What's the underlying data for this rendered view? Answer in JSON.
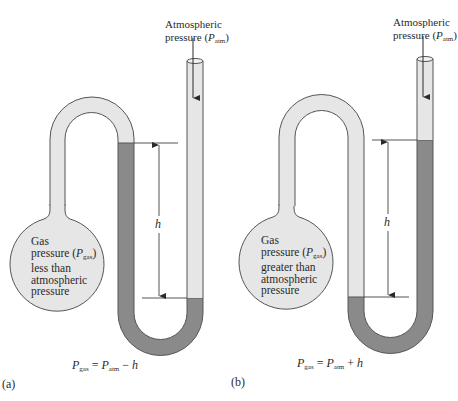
{
  "figure": {
    "colors": {
      "tube_fill": "#e6e6e6",
      "tube_stroke": "#555555",
      "liquid_fill": "#8a8a8a",
      "background": "#ffffff",
      "text": "#2a2a2a"
    },
    "panels": [
      {
        "id": "a",
        "panel_label": "(a)",
        "atm_label_line1": "Atmospheric",
        "atm_label_line2_prefix": "pressure (",
        "atm_symbol": "P",
        "atm_subscript": "atm",
        "atm_label_line2_suffix": ")",
        "gas_line1": "Gas",
        "gas_line2_prefix": "pressure (",
        "gas_symbol": "P",
        "gas_subscript": "gas",
        "gas_line2_suffix": ")",
        "gas_line3": "less than",
        "gas_line4": "atmospheric",
        "gas_line5": "pressure",
        "height_label": "h",
        "equation": {
          "lhs_symbol": "P",
          "lhs_subscript": "gas",
          "equals": " = ",
          "rhs_symbol": "P",
          "rhs_subscript": "atm",
          "operator": " − ",
          "term": "h"
        }
      },
      {
        "id": "b",
        "panel_label": "(b)",
        "atm_label_line1": "Atmospheric",
        "atm_label_line2_prefix": "pressure (",
        "atm_symbol": "P",
        "atm_subscript": "atm",
        "atm_label_line2_suffix": ")",
        "gas_line1": "Gas",
        "gas_line2_prefix": "pressure (",
        "gas_symbol": "P",
        "gas_subscript": "gas",
        "gas_line2_suffix": ")",
        "gas_line3": "greater than",
        "gas_line4": "atmospheric",
        "gas_line5": "pressure",
        "height_label": "h",
        "equation": {
          "lhs_symbol": "P",
          "lhs_subscript": "gas",
          "equals": " = ",
          "rhs_symbol": "P",
          "rhs_subscript": "atm",
          "operator": " + ",
          "term": "h"
        }
      }
    ]
  }
}
